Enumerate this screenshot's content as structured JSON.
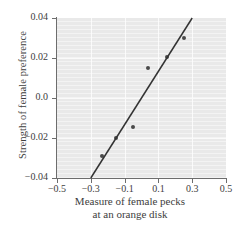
{
  "chart_data": {
    "type": "scatter",
    "title": "",
    "xlabel": "Measure of female pecks at an orange disk",
    "xlabel_line1": "Measure of female pecks",
    "xlabel_line2": "at an orange disk",
    "ylabel": "Strength of female preference",
    "xlim": [
      -0.5,
      0.5
    ],
    "ylim": [
      -0.04,
      0.04
    ],
    "xticks": [
      -0.5,
      -0.3,
      -0.1,
      0.1,
      0.3,
      0.5
    ],
    "xticklabels": [
      "-0.5",
      "-0.3",
      "-0.1",
      "0.1",
      "0.3",
      "0.5"
    ],
    "yticks": [
      -0.04,
      -0.02,
      0.0,
      0.02,
      0.04
    ],
    "yticklabels": [
      "-0.04",
      "-0.02",
      "0.0",
      "0.02",
      "0.04"
    ],
    "grid": true,
    "grid_color": "#fafafa",
    "plot_background": "#e9e9e9",
    "legend": "none",
    "point_color": "#4a4a4a",
    "line_color": "#333333",
    "points": [
      {
        "x": -0.235,
        "y": -0.029
      },
      {
        "x": -0.15,
        "y": -0.02
      },
      {
        "x": -0.05,
        "y": -0.0145
      },
      {
        "x": 0.04,
        "y": 0.015
      },
      {
        "x": 0.15,
        "y": 0.0205
      },
      {
        "x": 0.25,
        "y": 0.03
      }
    ],
    "series": [
      {
        "name": "observations",
        "x": [
          -0.235,
          -0.15,
          -0.05,
          0.04,
          0.15,
          0.25
        ],
        "values": [
          -0.029,
          -0.02,
          -0.0145,
          0.015,
          0.0205,
          0.03
        ]
      }
    ],
    "trendline": {
      "type": "linear-fit",
      "x_start": -0.3,
      "y_start": -0.04,
      "x_end": 0.3,
      "y_end": 0.04,
      "slope": 0.1333,
      "intercept": 0.0
    }
  }
}
